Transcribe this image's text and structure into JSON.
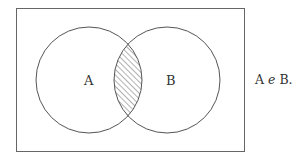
{
  "diagram": {
    "type": "venn",
    "sets": [
      {
        "label": "A"
      },
      {
        "label": "B"
      }
    ],
    "shaded_region": "A ∩ B",
    "caption": {
      "part1": "A",
      "connector": "e",
      "part2": "B."
    },
    "colors": {
      "stroke": "#555555",
      "background": "#ffffff"
    }
  }
}
